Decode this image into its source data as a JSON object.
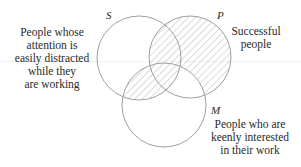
{
  "diagram": {
    "type": "venn",
    "sets": [
      {
        "letter": "S",
        "label": "People whose attention is easily distracted while they are working",
        "lines": [
          "People whose",
          "attention is",
          "easily distracted",
          "while they",
          "are working"
        ]
      },
      {
        "letter": "P",
        "label": "Successful people",
        "lines": [
          "Successful",
          "people"
        ]
      },
      {
        "letter": "M",
        "label": "People who are keenly interested in their work",
        "lines": [
          "People who are",
          "keenly interested",
          "in their work"
        ]
      }
    ],
    "shaded_regions": [
      "P only",
      "S∩P (not M)",
      "S∩M (not P)",
      "S∩P∩M"
    ],
    "colors": {
      "stroke": "#a0a0a0",
      "hatch": "#b8b8b8",
      "text": "#2a2a2a"
    }
  }
}
